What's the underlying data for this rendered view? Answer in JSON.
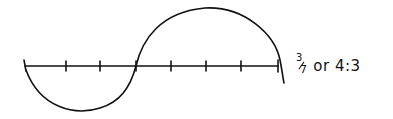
{
  "diagram": {
    "type": "hand-drawn ratio number line",
    "axis": {
      "tick_count": 8,
      "tick_x": [
        25,
        66,
        100,
        136,
        171,
        206,
        241,
        278
      ],
      "axis_y": 66
    },
    "lower_arc": {
      "spans_ticks": [
        0,
        3
      ],
      "segments": 3,
      "direction": "below"
    },
    "upper_arc": {
      "spans_ticks": [
        3,
        7
      ],
      "segments": 4,
      "direction": "above"
    },
    "label": {
      "fraction_numerator": "3",
      "fraction_denominator": "7",
      "connector": "or",
      "ratio": "4:3"
    },
    "stroke_color": "#111111",
    "background_color": "#ffffff"
  }
}
